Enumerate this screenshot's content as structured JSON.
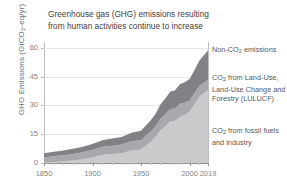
{
  "chart_data": {
    "type": "area",
    "stacked": true,
    "title": "Greenhouse gas (GHG) emissions resulting from human activities continue to increase",
    "xlabel": "",
    "ylabel": "GHG Emissions (GtCO2-eq/yr)",
    "ylabel_parts": {
      "pre": "GHG Emissions (GtCO",
      "sub": "2",
      "post": "-eq/yr)"
    },
    "xlim": [
      1850,
      2019
    ],
    "ylim": [
      0,
      63
    ],
    "yticks": [
      0,
      15,
      30,
      45,
      60
    ],
    "xticks": [
      1850,
      1900,
      1950,
      2000,
      2019
    ],
    "xticks_minor": [
      1860,
      1870,
      1880,
      1890,
      1910,
      1920,
      1930,
      1940,
      1960,
      1970,
      1980,
      1990,
      2010
    ],
    "grid": "horizontal",
    "legend_position": "right",
    "colors": {
      "fossil": "#c9cacc",
      "lulucf": "#a7a9ac",
      "nonco2": "#808285",
      "background": "#ffffff",
      "axis": "#939598",
      "gridline": "#e6e7e8",
      "text": "#58585a",
      "title_text": "#414042"
    },
    "x": [
      1850,
      1860,
      1870,
      1880,
      1890,
      1900,
      1910,
      1920,
      1930,
      1940,
      1950,
      1955,
      1960,
      1965,
      1970,
      1975,
      1980,
      1985,
      1990,
      1995,
      2000,
      2005,
      2010,
      2015,
      2019
    ],
    "series": [
      {
        "name": "CO2 from fossil fuels and industry",
        "legend_label_parts": {
          "pre": "CO",
          "sub": "2",
          "post": " from fossil fuels and industry"
        },
        "color": "#c9cacc",
        "values": [
          0.2,
          0.5,
          0.8,
          1.3,
          2.0,
          2.9,
          4.2,
          4.7,
          5.1,
          6.5,
          7.0,
          9.0,
          11.0,
          13.5,
          17.0,
          19.0,
          21.5,
          22.0,
          24.0,
          25.0,
          26.5,
          30.5,
          34.5,
          36.5,
          38.0
        ]
      },
      {
        "name": "CO2 from Land-Use, Land-Use Change and Forestry (LULUCF)",
        "legend_label_parts": {
          "pre": "CO",
          "sub": "2",
          "post": " from Land-Use, Land-Use Change and Forestry (LULUCF)"
        },
        "color": "#a7a9ac",
        "values": [
          2.8,
          3.0,
          3.2,
          3.4,
          3.6,
          3.9,
          4.2,
          4.3,
          4.5,
          4.8,
          5.0,
          5.2,
          5.4,
          5.6,
          6.0,
          6.4,
          6.6,
          6.4,
          6.8,
          6.4,
          6.0,
          5.8,
          5.6,
          5.4,
          5.4
        ]
      },
      {
        "name": "Non-CO2 emissions",
        "legend_label_parts": {
          "pre": "Non-CO",
          "sub": "2",
          "post": " emissions"
        },
        "color": "#808285",
        "values": [
          2.1,
          2.3,
          2.5,
          2.7,
          2.9,
          3.1,
          3.5,
          3.7,
          4.0,
          4.4,
          4.8,
          5.3,
          5.8,
          6.6,
          7.4,
          8.2,
          9.0,
          9.5,
          10.2,
          10.6,
          11.2,
          12.0,
          13.2,
          14.3,
          15.2
        ]
      }
    ],
    "totals": [
      5.1,
      5.8,
      6.5,
      7.4,
      8.5,
      9.9,
      11.9,
      12.7,
      13.6,
      15.7,
      16.8,
      19.5,
      22.2,
      25.7,
      30.4,
      33.6,
      37.1,
      37.9,
      41.0,
      42.0,
      43.7,
      48.3,
      53.3,
      56.2,
      58.6
    ]
  },
  "legend": [
    {
      "pre": "Non-CO",
      "sub": "2",
      "post": " emissions"
    },
    {
      "pre": "CO",
      "sub": "2",
      "post": " from Land-Use, Land-Use Change and Forestry (LULUCF)"
    },
    {
      "pre": "CO",
      "sub": "2",
      "post": " from fossil fuels and industry"
    }
  ]
}
